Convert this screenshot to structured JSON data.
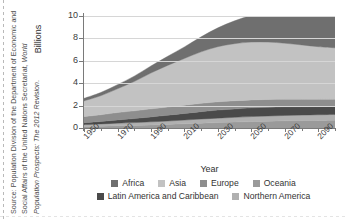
{
  "figure": {
    "source_note_prefix": "Source: Population Division of the Department of Economic and Social Affairs of the United Nations Secretariat, ",
    "source_note_italic": "World Population Prospects: The 2012 Revision",
    "source_note_suffix": "."
  },
  "legend": {
    "rows": [
      [
        {
          "label": "Africa",
          "color": "#6f6f6f"
        },
        {
          "label": "Asia",
          "color": "#c2c2c2"
        },
        {
          "label": "Europe",
          "color": "#8e8e8e"
        },
        {
          "label": "Oceania",
          "color": "#9a9a9a"
        }
      ],
      [
        {
          "label": "Latin America and Caribbean",
          "color": "#4a4a4a"
        },
        {
          "label": "Northern America",
          "color": "#b0b0b0"
        }
      ]
    ]
  },
  "chart_data": {
    "type": "area",
    "title": "",
    "xlabel": "Year",
    "ylabel": "Billions",
    "stacked": true,
    "grid": true,
    "legend_position": "bottom",
    "xlim": [
      1950,
      2100
    ],
    "ylim": [
      0,
      10
    ],
    "yticks": [
      0,
      2,
      4,
      6,
      8,
      10
    ],
    "xticks": [
      1950,
      1970,
      1990,
      2010,
      2030,
      2050,
      2070,
      2090
    ],
    "xtick_labels": [
      "1950",
      "1970",
      "1990",
      "2010",
      "2030",
      "2050",
      "2070",
      "2090"
    ],
    "ytick_labels": [
      "0",
      "2",
      "4",
      "6",
      "8",
      "10"
    ],
    "x": [
      1950,
      1960,
      1970,
      1980,
      1990,
      2000,
      2010,
      2020,
      2030,
      2040,
      2050,
      2060,
      2070,
      2080,
      2090,
      2100
    ],
    "series": [
      {
        "name": "Oceania",
        "color": "#9a9a9a",
        "values": [
          0.13,
          0.16,
          0.2,
          0.23,
          0.27,
          0.31,
          0.37,
          0.43,
          0.48,
          0.53,
          0.57,
          0.61,
          0.64,
          0.66,
          0.68,
          0.7
        ]
      },
      {
        "name": "Northern America",
        "color": "#b0b0b0",
        "values": [
          0.17,
          0.2,
          0.23,
          0.25,
          0.28,
          0.31,
          0.34,
          0.37,
          0.4,
          0.42,
          0.45,
          0.46,
          0.48,
          0.49,
          0.5,
          0.51
        ]
      },
      {
        "name": "Latin America and Caribbean",
        "color": "#4a4a4a",
        "values": [
          0.17,
          0.22,
          0.29,
          0.36,
          0.44,
          0.52,
          0.59,
          0.66,
          0.72,
          0.75,
          0.78,
          0.78,
          0.77,
          0.75,
          0.73,
          0.71
        ]
      },
      {
        "name": "Europe",
        "color": "#8e8e8e",
        "values": [
          0.55,
          0.6,
          0.66,
          0.69,
          0.72,
          0.73,
          0.74,
          0.74,
          0.74,
          0.73,
          0.71,
          0.7,
          0.68,
          0.67,
          0.65,
          0.64
        ]
      },
      {
        "name": "Asia",
        "color": "#c2c2c2",
        "values": [
          1.4,
          1.7,
          2.12,
          2.62,
          3.2,
          3.72,
          4.17,
          4.6,
          4.92,
          5.1,
          5.16,
          5.12,
          5.0,
          4.85,
          4.7,
          4.6
        ]
      },
      {
        "name": "Africa",
        "color": "#6f6f6f",
        "values": [
          0.23,
          0.29,
          0.37,
          0.48,
          0.63,
          0.81,
          1.03,
          1.34,
          1.68,
          2.04,
          2.39,
          2.73,
          3.04,
          3.3,
          3.5,
          3.64
        ]
      }
    ],
    "totals": [
      2.53,
      3.03,
      3.7,
      4.45,
      5.32,
      6.13,
      6.93,
      7.72,
      8.42,
      9.04,
      9.55,
      9.94,
      10.21,
      10.38,
      10.48,
      10.54
    ]
  }
}
